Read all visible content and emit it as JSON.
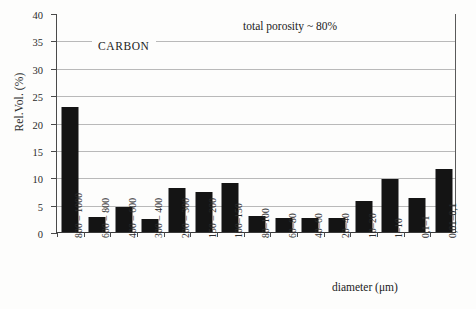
{
  "chart_data": {
    "type": "bar",
    "title": "",
    "xlabel": "diameter (μm)",
    "ylabel": "Rel.Vol. (%)",
    "ylim": [
      0,
      40
    ],
    "yticks": [
      0,
      5,
      10,
      15,
      20,
      25,
      30,
      35,
      40
    ],
    "grid": true,
    "legend": "none",
    "categories": [
      "800 – 1000",
      "600 – 800",
      "400 – 600",
      "300 – 400",
      "200 – 300",
      "150 – 200",
      "100–150",
      "80–100",
      "60–80",
      "40–60",
      "20–40",
      "10–20",
      "1–10",
      "0,1–1",
      "0,01–0,1"
    ],
    "values": [
      22.8,
      2.7,
      4.6,
      2.3,
      8.0,
      7.4,
      9.0,
      3.0,
      2.5,
      2.5,
      2.6,
      5.7,
      9.6,
      6.2,
      11.5
    ],
    "annotations": [
      {
        "text": "total porosity ~ 80%"
      },
      {
        "text": "CARBON"
      }
    ],
    "colors": {
      "bar": "#141414",
      "grid": "#b9b9b9",
      "axis": "#3a3a3a",
      "background": "#fdfdfc"
    }
  },
  "annotations": {
    "porosity": "total porosity ~ 80%",
    "material": "CARBON"
  }
}
